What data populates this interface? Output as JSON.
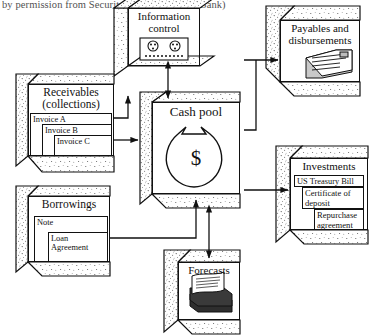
{
  "caption": "by permission from Security Pacific National Bank)",
  "diagram": {
    "type": "flow-diagram",
    "style": {
      "line_color": "#111111",
      "face_fill": "#ffffff",
      "stipple_color": "#4a4a4a",
      "background": "#ffffff"
    },
    "nodes": [
      {
        "id": "information-control",
        "label": "Information control",
        "label_lines": [
          "Information",
          "control"
        ],
        "icon": "control-device-icon",
        "x": 128,
        "y": 8,
        "w": 72,
        "h": 58
      },
      {
        "id": "payables",
        "label": "Payables and disbursements",
        "label_lines": [
          "Payables and",
          "disbursements"
        ],
        "icon": "document-stack-icon",
        "x": 280,
        "y": 20,
        "w": 80,
        "h": 62
      },
      {
        "id": "receivables",
        "label": "Receivables (collections)",
        "label_lines": [
          "Receivables",
          "(collections)"
        ],
        "items": [
          "Invoice A",
          "Invoice B",
          "Invoice C"
        ],
        "x": 28,
        "y": 84,
        "w": 86,
        "h": 72
      },
      {
        "id": "cash-pool",
        "label": "Cash pool",
        "label_lines": [
          "Cash pool"
        ],
        "icon": "money-bag-icon",
        "symbol": "$",
        "x": 152,
        "y": 102,
        "w": 88,
        "h": 92
      },
      {
        "id": "investments",
        "label": "Investments",
        "label_lines": [
          "Investments"
        ],
        "items": [
          "US Treasury Bill",
          "Certificate of deposit",
          "Repurchase agreement"
        ],
        "x": 290,
        "y": 158,
        "w": 78,
        "h": 72
      },
      {
        "id": "borrowings",
        "label": "Borrowings",
        "label_lines": [
          "Borrowings"
        ],
        "items": [
          "Note",
          "Loan Agreement"
        ],
        "x": 28,
        "y": 196,
        "w": 82,
        "h": 66
      },
      {
        "id": "forecasts",
        "label": "Forecasts",
        "label_lines": [
          "Forecasts"
        ],
        "icon": "paper-stack-icon",
        "x": 178,
        "y": 262,
        "w": 62,
        "h": 58
      }
    ],
    "edges": [
      {
        "id": "edge-info-cash",
        "from": "information-control",
        "to": "cash-pool",
        "direction": "both"
      },
      {
        "id": "edge-receivables-cash",
        "from": "receivables",
        "to": "cash-pool",
        "direction": "to"
      },
      {
        "id": "edge-borrowings-cash",
        "from": "borrowings",
        "to": "cash-pool",
        "direction": "to"
      },
      {
        "id": "edge-cash-payables",
        "from": "cash-pool",
        "to": "payables",
        "direction": "to"
      },
      {
        "id": "edge-cash-investments",
        "from": "cash-pool",
        "to": "investments",
        "direction": "to"
      },
      {
        "id": "edge-cash-forecasts",
        "from": "cash-pool",
        "to": "forecasts",
        "direction": "both"
      }
    ]
  }
}
